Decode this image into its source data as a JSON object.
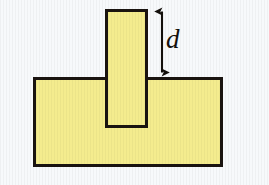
{
  "figure": {
    "type": "technical-diagram",
    "canvas": {
      "width": 269,
      "height": 185
    },
    "background_color": "#f7f9fb",
    "fill_color": "#f4ec8e",
    "stroke_color": "#1a1410",
    "stroke_width": 3
  },
  "shapes": {
    "base_slab": {
      "name": "base-slab",
      "x": 33,
      "y": 77,
      "width": 190,
      "height": 90,
      "fill": "#f4ec8e",
      "stroke": "#1a1410"
    },
    "vertical_bar": {
      "name": "vertical-bar",
      "x": 105,
      "y": 9,
      "width": 43,
      "height": 119,
      "fill": "#f4ec8e",
      "stroke": "#1a1410"
    }
  },
  "annotations": {
    "dimension_arrow": {
      "name": "dimension-arrow-d",
      "orientation": "vertical",
      "double_headed": true,
      "x": 162,
      "y_top": 9,
      "y_bottom": 74,
      "measures": "protruding height of vertical bar above base slab",
      "color": "#14100c"
    },
    "labels": [
      {
        "name": "dimension-label-d",
        "text": "d",
        "style": "italic",
        "x": 166,
        "y": 26,
        "font_size": 27,
        "color": "#14100c"
      }
    ]
  }
}
